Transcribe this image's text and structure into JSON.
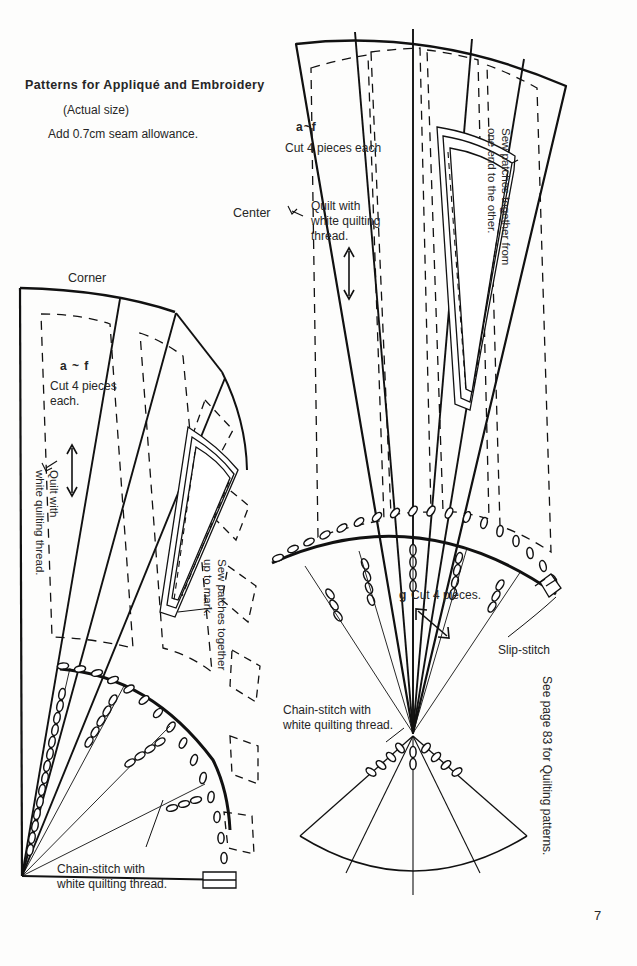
{
  "page": {
    "number": "7",
    "background_color": "#fdfdfc",
    "ink_color": "#1a1a1a"
  },
  "header": {
    "title": "Patterns for Appliqué and Embroidery",
    "subtitle": "(Actual size)",
    "seam_note": "Add 0.7cm seam allowance."
  },
  "sections": {
    "center_label": "Center",
    "corner_label": "Corner"
  },
  "center_block": {
    "piece_range": "a~f",
    "cut_note": "Cut 4 pieces each",
    "quilt_note": "Quilt with\nwhite quilting\nthread.",
    "sew_note": "Sew patches together from\none end to the other.",
    "g_label": "g",
    "g_cut_note": "Cut 4 pieces.",
    "slip_stitch": "Slip-stitch",
    "chain_stitch": "Chain-stitch with\nwhite quilting thread."
  },
  "corner_block": {
    "piece_range": "a ~ f",
    "cut_note": "Cut 4 pieces\neach.",
    "quilt_note": "Quilt with\nwhite quilting thread.",
    "sew_note": "Sew patches together\nup to mark.",
    "chain_stitch": "Chain-stitch with\nwhite quilting thread."
  },
  "footer": {
    "reference": "See page 83 for Quilting patterns."
  }
}
